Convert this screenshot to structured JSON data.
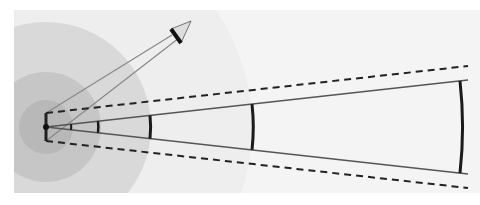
{
  "diagram": {
    "type": "beam-spread-diagram",
    "origin": {
      "x": 46,
      "y": 127
    },
    "background_panel": {
      "x": 14,
      "y": 10,
      "width": 466,
      "height": 183,
      "color": "#f4f4f4"
    },
    "zones": [
      {
        "name": "outer-zone",
        "radius": 206,
        "color": "#eeeeee"
      },
      {
        "name": "large-zone",
        "radius": 105,
        "color": "#d9d9d9"
      },
      {
        "name": "mid-zone",
        "radius": 55,
        "color": "#c6c6c6"
      },
      {
        "name": "inner-zone",
        "radius": 27,
        "color": "#b8b8b8"
      }
    ],
    "source_bar": {
      "y_top": 113,
      "y_bottom": 141
    },
    "beam_solid": {
      "end_x": 468,
      "top_end_y": 80,
      "bottom_end_y": 174,
      "color": "#555555"
    },
    "beam_dashed": {
      "end_x": 468,
      "top_end_y": 66,
      "bottom_end_y": 188,
      "color": "#222222"
    },
    "wavefronts": [
      {
        "x": 71,
        "width": 2
      },
      {
        "x": 98,
        "width": 2.5
      },
      {
        "x": 150,
        "width": 3
      },
      {
        "x": 252,
        "width": 3
      },
      {
        "x": 460,
        "width": 3
      }
    ],
    "arrow": {
      "tip": {
        "x": 191,
        "y": 21
      },
      "base_a": {
        "x": 171,
        "y": 29
      },
      "base_b": {
        "x": 181,
        "y": 43
      },
      "fill": "#dddddd",
      "line_color": "#888888"
    }
  }
}
